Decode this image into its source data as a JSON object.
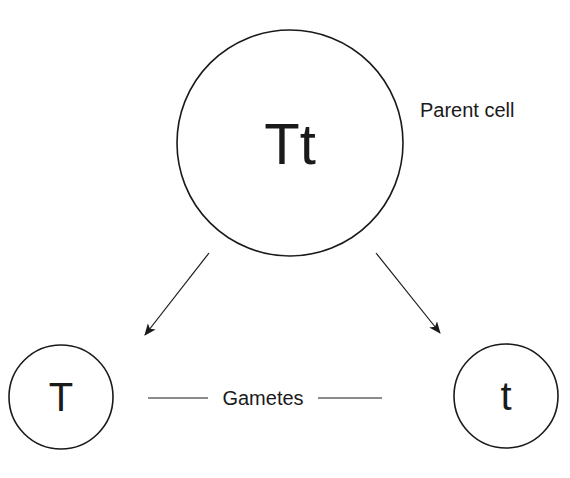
{
  "diagram": {
    "parent": {
      "genotype": "Tt",
      "label": "Parent cell"
    },
    "gametes": {
      "label": "Gametes",
      "left": {
        "allele": "T"
      },
      "right": {
        "allele": "t"
      }
    },
    "colors": {
      "stroke": "#1a1a1a",
      "background": "#ffffff"
    }
  }
}
